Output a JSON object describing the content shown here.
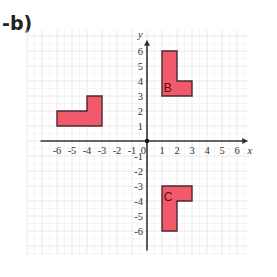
{
  "problem_label": "-b)",
  "grid": {
    "origin_px": [
      147,
      141
    ],
    "unit_px": 15,
    "x_range": [
      -8,
      6.8
    ],
    "y_range": [
      -7.6,
      7.4
    ],
    "grid_color": "#e4e4e4",
    "axis_color": "#333333"
  },
  "axes": {
    "x_label": "x",
    "y_label": "y",
    "x_ticks": [
      "-6",
      "-5",
      "-4",
      "-3",
      "-2",
      "-1",
      "1",
      "2",
      "3",
      "4",
      "5",
      "6"
    ],
    "x_tick_values": [
      -6,
      -5,
      -4,
      -3,
      -2,
      -1,
      1,
      2,
      3,
      4,
      5,
      6
    ],
    "y_ticks": [
      "6",
      "5",
      "4",
      "3",
      "2",
      "1",
      "-1",
      "-2",
      "-3",
      "-4",
      "-5",
      "-6"
    ],
    "y_tick_values": [
      6,
      5,
      4,
      3,
      2,
      1,
      -1,
      -2,
      -3,
      -4,
      -5,
      -6
    ],
    "origin_label": "0"
  },
  "shapes": [
    {
      "name": "shape-a",
      "label": "",
      "fill": "#f05a6a",
      "stroke": "#4a2a2e",
      "points": [
        [
          -6,
          1
        ],
        [
          -3,
          1
        ],
        [
          -3,
          3
        ],
        [
          -4,
          3
        ],
        [
          -4,
          2
        ],
        [
          -6,
          2
        ]
      ]
    },
    {
      "name": "shape-b",
      "label": "B",
      "label_pos": [
        1.05,
        3.55
      ],
      "fill": "#f05a6a",
      "stroke": "#4a2a2e",
      "points": [
        [
          1,
          3
        ],
        [
          3,
          3
        ],
        [
          3,
          4
        ],
        [
          2,
          4
        ],
        [
          2,
          6
        ],
        [
          1,
          6
        ]
      ]
    },
    {
      "name": "shape-c",
      "label": "C",
      "label_pos": [
        1.05,
        -3.75
      ],
      "fill": "#f05a6a",
      "stroke": "#4a2a2e",
      "points": [
        [
          1,
          -3
        ],
        [
          3,
          -3
        ],
        [
          3,
          -4
        ],
        [
          2,
          -4
        ],
        [
          2,
          -6
        ],
        [
          1,
          -6
        ]
      ]
    }
  ]
}
